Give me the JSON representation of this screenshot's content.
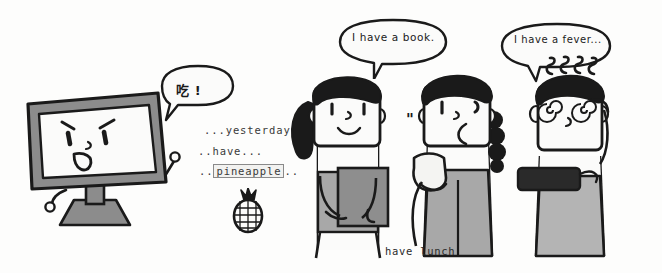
{
  "scene": {
    "title": "have lunch",
    "background_color": "#fdfdfc",
    "ink_color": "#1a1a1a",
    "width": 662,
    "height": 273
  },
  "caption": {
    "text": "have lunch"
  },
  "monitor": {
    "name": "angry-computer-monitor",
    "bezel_color": "#8c8c8c",
    "screen_color": "#fbfbfa",
    "expression": "angry",
    "speech": {
      "text": "吃 !",
      "meaning_label": "chi"
    }
  },
  "annotations": {
    "line1": "...yesterday...",
    "line2": "..have...",
    "line3_prefix": "..",
    "line3_boxed": "pineapple",
    "line3_suffix": "..",
    "icon": "pineapple-icon"
  },
  "characters": [
    {
      "id": "person-1",
      "name": "girl-with-book",
      "hair": "black-ponytail",
      "expression": "smiling",
      "item": "book",
      "item_color": "#8e8e8e",
      "shirt_color": "#a8a8a8",
      "speech": "I have a book."
    },
    {
      "id": "person-2",
      "name": "girl-with-braid",
      "hair": "black-braid",
      "expression": "frowning",
      "item": "sandwich",
      "item_color": "#f4f4f2",
      "shirt_color": "#a8a8a8",
      "speech": "",
      "quote_mark": "\""
    },
    {
      "id": "person-3",
      "name": "sick-person-with-thermometer",
      "hair": "black-short",
      "expression": "dizzy-spiral-eyes",
      "item": "thermometer",
      "item_color": "#2a2a2a",
      "shirt_color": "#b4b4b4",
      "speech": "I have a fever...",
      "heat_squiggles": 4
    }
  ],
  "bubbles": [
    {
      "id": "bubble-1",
      "owner": "monitor",
      "text": "吃 !"
    },
    {
      "id": "bubble-2",
      "owner": "person-1",
      "text": "I have a book."
    },
    {
      "id": "bubble-3",
      "owner": "person-3",
      "text": "I have a fever..."
    }
  ]
}
